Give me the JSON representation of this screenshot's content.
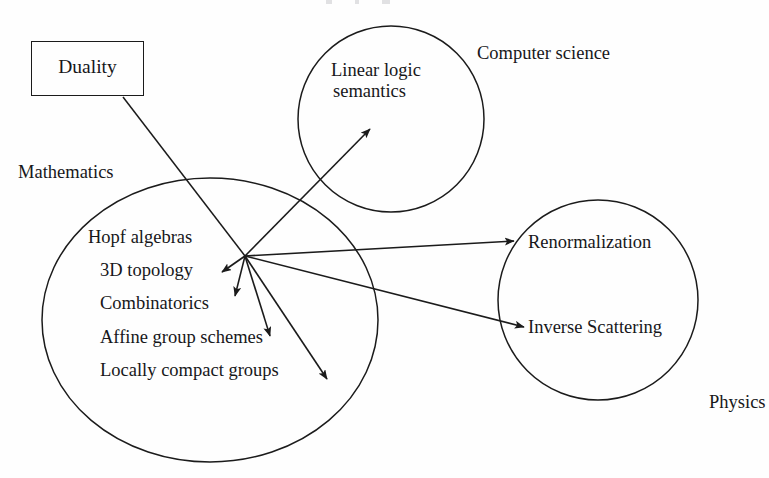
{
  "figure": {
    "type": "diagram",
    "subtype": "venn-style concept map with arrows",
    "background_color": "#fefefe",
    "stroke_color": "#1b1b1b",
    "text_color": "#17171a"
  },
  "box": {
    "name": "Duality",
    "label": "Duality"
  },
  "domains": [
    {
      "id": "mathematics",
      "label": "Mathematics"
    },
    {
      "id": "computer_science",
      "label": "Computer science"
    },
    {
      "id": "physics",
      "label": "Physics"
    }
  ],
  "mathematics": {
    "domain_label": "Mathematics",
    "items": [
      "Hopf algebras",
      "3D topology",
      "Combinatorics",
      "Affine group schemes",
      "Locally compact groups"
    ]
  },
  "computer_science": {
    "domain_label": "Computer science",
    "node_line1": "Linear logic",
    "node_line2": "semantics"
  },
  "physics": {
    "domain_label": "Physics",
    "items": [
      "Renormalization",
      "Inverse Scattering"
    ]
  },
  "connections": [
    {
      "from": "Duality",
      "to": "hub",
      "arrowhead": false
    },
    {
      "from": "hub",
      "to": "Linear logic semantics",
      "arrowhead": true
    },
    {
      "from": "hub",
      "to": "Renormalization",
      "arrowhead": true
    },
    {
      "from": "hub",
      "to": "Inverse Scattering",
      "arrowhead": true
    },
    {
      "from": "hub",
      "to": "Hopf algebras",
      "arrowhead": true
    },
    {
      "from": "hub",
      "to": "3D topology",
      "arrowhead": true
    },
    {
      "from": "hub",
      "to": "Combinatorics",
      "arrowhead": true
    },
    {
      "from": "hub",
      "to": "Affine group schemes",
      "arrowhead": true
    }
  ]
}
